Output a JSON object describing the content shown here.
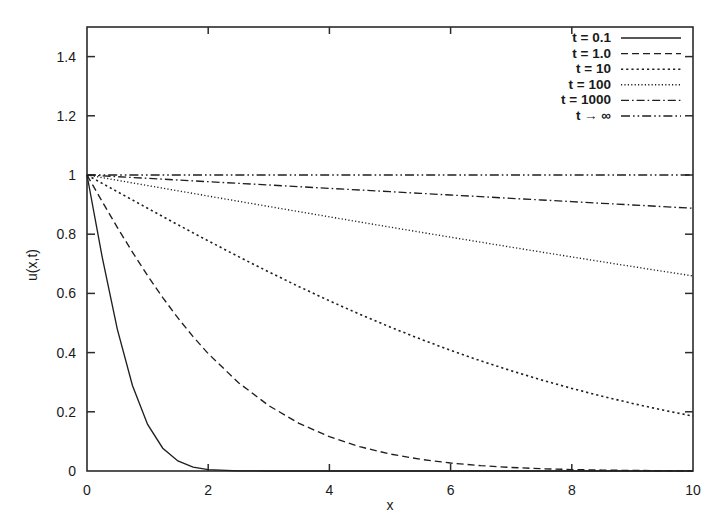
{
  "chart_data": {
    "type": "line",
    "title": "",
    "xlabel": "x",
    "ylabel": "u(x,t)",
    "xlim": [
      0,
      10
    ],
    "ylim": [
      0,
      1.5
    ],
    "xticks": [
      "0",
      "2",
      "4",
      "6",
      "8",
      "10"
    ],
    "xtick_values": [
      0,
      2,
      4,
      6,
      8,
      10
    ],
    "yticks": [
      "0",
      "0.2",
      "0.4",
      "0.6",
      "0.8",
      "1",
      "1.2",
      "1.4"
    ],
    "ytick_values": [
      0,
      0.2,
      0.4,
      0.6,
      0.8,
      1.0,
      1.2,
      1.4
    ],
    "grid": false,
    "legend_position": "top-right",
    "x": [
      0,
      0.25,
      0.5,
      0.75,
      1,
      1.25,
      1.5,
      1.75,
      2,
      2.5,
      3,
      3.5,
      4,
      4.5,
      5,
      5.5,
      6,
      6.5,
      7,
      7.5,
      8,
      8.5,
      9,
      9.5,
      10
    ],
    "series": [
      {
        "name": "t = 0.1",
        "dash": "none",
        "values": [
          1,
          0.7236,
          0.4795,
          0.2888,
          0.1573,
          0.0771,
          0.0339,
          0.0133,
          0.0047,
          0.0004,
          2e-05,
          0,
          0,
          0,
          0,
          0,
          0,
          0,
          0,
          0,
          0,
          0,
          0,
          0,
          0
        ]
      },
      {
        "name": "t = 1.0",
        "dash": "dashed",
        "values": [
          1,
          0.9104,
          0.8231,
          0.7394,
          0.66,
          0.5858,
          0.5171,
          0.454,
          0.3966,
          0.2983,
          0.2207,
          0.1609,
          0.1158,
          0.0821,
          0.0574,
          0.0396,
          0.0269,
          0.018,
          0.0119,
          0.0077,
          0.0049,
          0.0031,
          0.0019,
          0.0011,
          0.0007
        ]
      },
      {
        "name": "t = 10",
        "dash": "dotted",
        "values": [
          1,
          0.9718,
          0.9436,
          0.9155,
          0.8875,
          0.8597,
          0.832,
          0.8046,
          0.7775,
          0.7242,
          0.6725,
          0.6227,
          0.575,
          0.5296,
          0.4865,
          0.4459,
          0.4077,
          0.3719,
          0.3386,
          0.3077,
          0.279,
          0.2526,
          0.2283,
          0.206,
          0.1855
        ]
      },
      {
        "name": "t = 100",
        "dash": "fine-dotted",
        "values": [
          1,
          0.9911,
          0.9822,
          0.9733,
          0.9644,
          0.9555,
          0.9466,
          0.9378,
          0.9289,
          0.9112,
          0.8936,
          0.8761,
          0.8586,
          0.8413,
          0.824,
          0.8069,
          0.7899,
          0.773,
          0.7562,
          0.7396,
          0.7232,
          0.7069,
          0.6907,
          0.6748,
          0.659
        ]
      },
      {
        "name": "t = 1000",
        "dash": "dash-dot",
        "values": [
          1,
          0.9972,
          0.9944,
          0.9915,
          0.9887,
          0.9859,
          0.9831,
          0.9803,
          0.9774,
          0.9718,
          0.9662,
          0.9605,
          0.9549,
          0.9493,
          0.9437,
          0.938,
          0.9324,
          0.9268,
          0.9212,
          0.9156,
          0.91,
          0.9044,
          0.8988,
          0.8932,
          0.8876
        ]
      },
      {
        "name": "t → ∞",
        "dash": "dash-dot-dot",
        "values": [
          1,
          1,
          1,
          1,
          1,
          1,
          1,
          1,
          1,
          1,
          1,
          1,
          1,
          1,
          1,
          1,
          1,
          1,
          1,
          1,
          1,
          1,
          1,
          1,
          1
        ]
      }
    ]
  },
  "legend": {
    "entries": [
      {
        "label": "t = 0.1"
      },
      {
        "label": "t = 1.0"
      },
      {
        "label": "t = 10"
      },
      {
        "label": "t = 100"
      },
      {
        "label": "t = 1000"
      },
      {
        "label": "t → ∞"
      }
    ]
  },
  "colors": {
    "curve": "#1f1f1f",
    "axis": "#2b2b2b",
    "background": "#ffffff"
  }
}
